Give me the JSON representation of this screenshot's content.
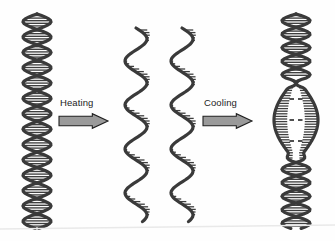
{
  "figure": {
    "background_color": "#fefefe",
    "width": 335,
    "height": 241
  },
  "palette": {
    "strand_dark": "#4a4a4a",
    "strand_outline": "#2e2e2e",
    "rung_color": "#3f3f3f",
    "arrow_fill": "#9a9a9a",
    "arrow_outline": "#1f1f1f",
    "text_color": "#1c1c1c",
    "bubble_interior": "#ffffff",
    "scan_line": "#e8e8e8"
  },
  "steps": [
    {
      "id": "duplex",
      "name": "double-stranded-dna",
      "state_label": "",
      "turns": 7,
      "description": "Intact DNA double helix with paired bases"
    },
    {
      "id": "denatured",
      "name": "separated-single-strands",
      "state_label": "",
      "strand_count": 2,
      "description": "Two separated single strands with unpaired bases"
    },
    {
      "id": "renatured",
      "name": "reannealed-dna-with-bubble",
      "state_label": "",
      "turns_above_bubble": 2,
      "turns_below_bubble": 2,
      "bubble_dash_rows": 3,
      "description": "Reannealed duplex containing a central mismatch bubble"
    }
  ],
  "arrows": [
    {
      "id": "heating",
      "label": "Heating",
      "direction": "right",
      "label_x": 60,
      "label_y": 106,
      "body_x": 59,
      "body_y": 113,
      "body_w": 49,
      "body_h": 16
    },
    {
      "id": "cooling",
      "label": "Cooling",
      "direction": "right",
      "label_x": 204,
      "label_y": 106,
      "body_x": 203,
      "body_y": 113,
      "body_w": 49,
      "body_h": 16
    }
  ],
  "helix_geometry": {
    "duplex": {
      "center_x": 37,
      "top_y": 14,
      "bottom_y": 229,
      "amplitude": 14,
      "turn_height": 27
    },
    "single_left": {
      "center_x": 136,
      "top_y": 28,
      "bottom_y": 222,
      "amplitude": 11,
      "wave_height": 44
    },
    "single_right": {
      "center_x": 182,
      "top_y": 28,
      "bottom_y": 222,
      "amplitude": 11,
      "wave_height": 44
    },
    "renatured": {
      "center_x": 296,
      "top_y": 14,
      "bottom_y": 229,
      "amplitude": 14,
      "turn_height": 27,
      "bubble_top": 78,
      "bubble_bottom": 162,
      "bubble_half_width": 22
    }
  }
}
